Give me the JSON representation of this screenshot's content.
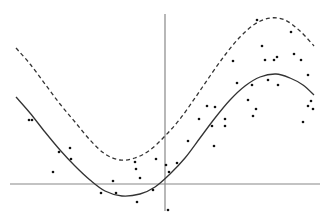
{
  "chart_data": {
    "type": "scatter",
    "title": "",
    "xlabel": "",
    "ylabel": "",
    "grid": false,
    "legend": null,
    "axes": {
      "color": "#888888",
      "x_axis": {
        "x1": 10,
        "x2": 320,
        "y": 184
      },
      "y_axis": {
        "x": 165,
        "y1": 14,
        "y2": 211
      }
    },
    "series": [
      {
        "name": "fitted-curve",
        "kind": "line",
        "style": "solid",
        "color": "#333333",
        "points": [
          [
            16,
            97
          ],
          [
            30,
            113
          ],
          [
            45,
            132
          ],
          [
            60,
            150
          ],
          [
            75,
            166
          ],
          [
            90,
            180
          ],
          [
            105,
            191
          ],
          [
            122,
            196
          ],
          [
            140,
            194
          ],
          [
            155,
            187
          ],
          [
            170,
            174
          ],
          [
            185,
            158
          ],
          [
            200,
            138
          ],
          [
            215,
            118
          ],
          [
            230,
            100
          ],
          [
            245,
            86
          ],
          [
            260,
            77
          ],
          [
            276,
            74
          ],
          [
            290,
            78
          ],
          [
            303,
            85
          ],
          [
            314,
            95
          ]
        ]
      },
      {
        "name": "upper-band",
        "kind": "line",
        "style": "dashed",
        "color": "#333333",
        "points": [
          [
            16,
            48
          ],
          [
            30,
            64
          ],
          [
            45,
            84
          ],
          [
            60,
            104
          ],
          [
            75,
            122
          ],
          [
            90,
            140
          ],
          [
            105,
            154
          ],
          [
            120,
            160
          ],
          [
            135,
            158
          ],
          [
            150,
            150
          ],
          [
            165,
            136
          ],
          [
            180,
            119
          ],
          [
            195,
            98
          ],
          [
            210,
            76
          ],
          [
            225,
            55
          ],
          [
            240,
            37
          ],
          [
            255,
            24
          ],
          [
            270,
            18
          ],
          [
            285,
            20
          ],
          [
            300,
            31
          ],
          [
            314,
            46
          ]
        ]
      },
      {
        "name": "observations",
        "kind": "scatter",
        "color": "#111111",
        "radius": 1.3,
        "points": [
          [
            29,
            120
          ],
          [
            32,
            120
          ],
          [
            53,
            172
          ],
          [
            59,
            152
          ],
          [
            70,
            148
          ],
          [
            71,
            159
          ],
          [
            101,
            193
          ],
          [
            113,
            181
          ],
          [
            116,
            193
          ],
          [
            135,
            162
          ],
          [
            136,
            169
          ],
          [
            140,
            178
          ],
          [
            137,
            202
          ],
          [
            153,
            190
          ],
          [
            156,
            159
          ],
          [
            166,
            165
          ],
          [
            168,
            210
          ],
          [
            169,
            172
          ],
          [
            177,
            163
          ],
          [
            188,
            141
          ],
          [
            199,
            119
          ],
          [
            207,
            106
          ],
          [
            212,
            126
          ],
          [
            214,
            146
          ],
          [
            215,
            107
          ],
          [
            225,
            119
          ],
          [
            225,
            126
          ],
          [
            233,
            61
          ],
          [
            237,
            83
          ],
          [
            248,
            100
          ],
          [
            252,
            85
          ],
          [
            253,
            116
          ],
          [
            256,
            109
          ],
          [
            257,
            20
          ],
          [
            262,
            46
          ],
          [
            265,
            60
          ],
          [
            268,
            80
          ],
          [
            274,
            60
          ],
          [
            277,
            57
          ],
          [
            278,
            85
          ],
          [
            291,
            32
          ],
          [
            294,
            54
          ],
          [
            301,
            60
          ],
          [
            303,
            122
          ],
          [
            308,
            75
          ],
          [
            308,
            106
          ],
          [
            311,
            101
          ],
          [
            313,
            109
          ]
        ]
      }
    ]
  }
}
